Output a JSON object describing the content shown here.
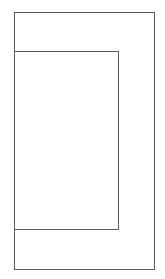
{
  "diagram": {
    "type": "nested-rectangles",
    "stroke_color": "#5a5a5a",
    "stroke_width": 1.5,
    "background": "#ffffff",
    "shapes": [
      {
        "id": "outer",
        "x": 14,
        "y": 12,
        "width": 141,
        "height": 258
      },
      {
        "id": "inner",
        "x": 14,
        "y": 51,
        "width": 105,
        "height": 179
      }
    ]
  }
}
